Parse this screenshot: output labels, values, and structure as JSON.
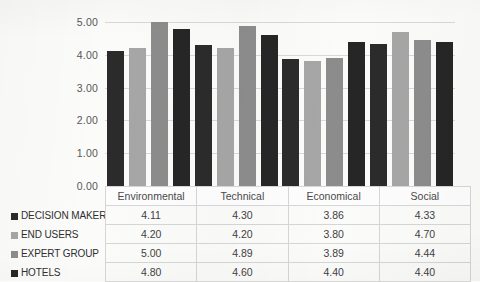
{
  "chart_data": {
    "type": "bar",
    "title": "",
    "xlabel": "",
    "ylabel": "",
    "ylim": [
      0,
      5
    ],
    "ytick_step": 1,
    "ytick_labels": [
      "0.00",
      "1.00",
      "2.00",
      "3.00",
      "4.00",
      "5.00"
    ],
    "grid": true,
    "legend_position": "table-row-labels",
    "categories": [
      "Environmental",
      "Technical",
      "Economical",
      "Social"
    ],
    "series": [
      {
        "name": "DECISION MAKERS",
        "color": "#2b2b2b",
        "values": [
          4.11,
          4.3,
          3.86,
          4.33
        ],
        "labels": [
          "4.11",
          "4.30",
          "3.86",
          "4.33"
        ]
      },
      {
        "name": "END USERS",
        "color": "#a6a6a6",
        "values": [
          4.2,
          4.2,
          3.8,
          4.7
        ],
        "labels": [
          "4.20",
          "4.20",
          "3.80",
          "4.70"
        ]
      },
      {
        "name": "EXPERT GROUP",
        "color": "#8c8c8c",
        "values": [
          5.0,
          4.89,
          3.89,
          4.44
        ],
        "labels": [
          "5.00",
          "4.89",
          "3.89",
          "4.44"
        ]
      },
      {
        "name": "HOTELS",
        "color": "#262626",
        "values": [
          4.8,
          4.6,
          4.4,
          4.4
        ],
        "labels": [
          "4.80",
          "4.60",
          "4.40",
          "4.40"
        ]
      }
    ]
  },
  "colors": {
    "background": "#fbfbfa",
    "gridline": "#d9d9d9",
    "axis_text": "#575757",
    "table_border": "#d6d6d6"
  }
}
